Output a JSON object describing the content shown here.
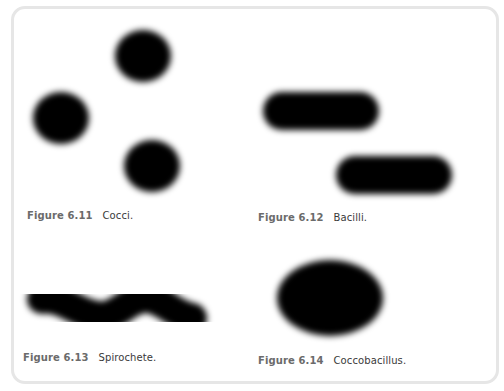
{
  "figures": [
    {
      "id": "6.11",
      "label": "Figure 6.11",
      "caption": "Cocci.",
      "shape": "coccus"
    },
    {
      "id": "6.12",
      "label": "Figure 6.12",
      "caption": "Bacilli.",
      "shape": "bacillus"
    },
    {
      "id": "6.13",
      "label": "Figure 6.13",
      "caption": "Spirochete.",
      "shape": "spirochete"
    },
    {
      "id": "6.14",
      "label": "Figure 6.14",
      "caption": "Coccobacillus.",
      "shape": "coccobacillus"
    }
  ],
  "colors": {
    "cell_fill": "#000000",
    "frame_border": "#e6e6e6",
    "label_text": "#6b6b6b",
    "caption_text": "#3a3a3a"
  }
}
